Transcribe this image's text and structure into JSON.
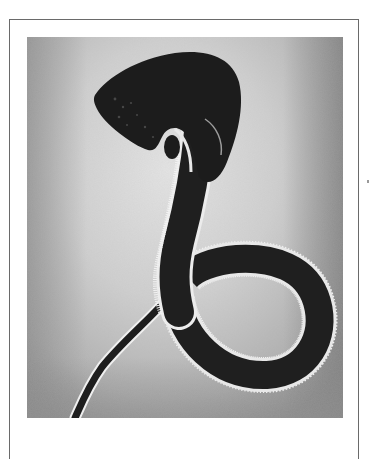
{
  "image": {
    "subject": "embroidered cobra serpent on textured fabric",
    "description": "Dark snake silhouette with hooded head, curling body with a loop at the bottom, and white beaded/stitched edging",
    "colors": {
      "background_fabric_light": "#d8d8d8",
      "background_fabric_mid": "#a8a8a8",
      "background_fabric_dark": "#8c8c8c",
      "serpent_body": "#1e1e1e",
      "stitch_edge": "#f2f2f2",
      "frame_border": "#6a6a6a",
      "page": "#ffffff"
    }
  }
}
